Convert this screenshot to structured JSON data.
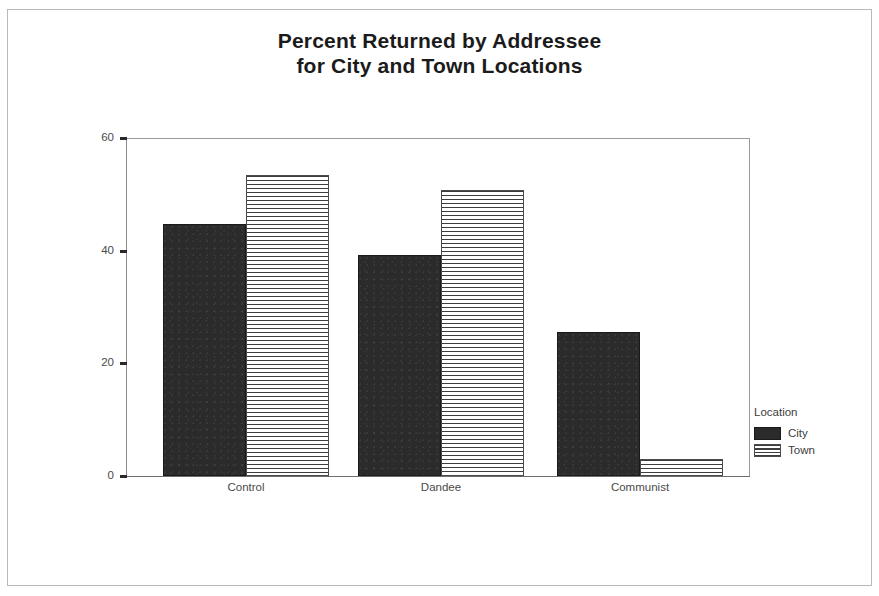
{
  "chart_data": {
    "type": "bar",
    "title": "Percent Returned by Addressee for City and Town Locations",
    "title_lines": [
      "Percent Returned by Addressee",
      "for City and Town Locations"
    ],
    "xlabel": "",
    "ylabel": "",
    "categories": [
      "Control",
      "Dandee",
      "Communist"
    ],
    "series": [
      {
        "name": "City",
        "values": [
          44.7,
          39.3,
          25.6
        ],
        "color": "#2b2b2b",
        "fill": "solid"
      },
      {
        "name": "Town",
        "values": [
          53.5,
          50.8,
          3.1
        ],
        "color": "#3d3d3d",
        "fill": "horizontal-stripes"
      }
    ],
    "ylim": [
      0,
      60
    ],
    "yticks": [
      0,
      20,
      40,
      60
    ],
    "ytick_labels": [
      "0",
      "20",
      "40",
      "60"
    ],
    "grid": false,
    "legend": {
      "title": "Location",
      "position": "right",
      "entries": [
        "City",
        "Town"
      ]
    }
  },
  "legend": {
    "title": "Location",
    "items": [
      {
        "label": "City",
        "swatch": "solid-dark"
      },
      {
        "label": "Town",
        "swatch": "striped"
      }
    ]
  }
}
